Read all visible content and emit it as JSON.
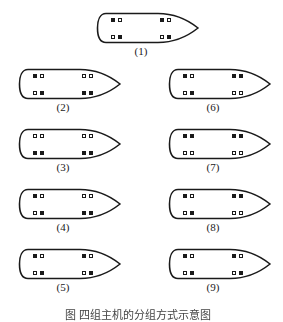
{
  "figure": {
    "caption": "图 四组主机的分组方式示意图",
    "ships": [
      {
        "id": "1",
        "label": "(1)",
        "top_left": [
          "filled",
          "empty"
        ],
        "top_right": [
          "filled",
          "empty"
        ],
        "bottom_left": [
          "empty",
          "filled"
        ],
        "bottom_right": [
          "empty",
          "filled"
        ]
      },
      {
        "id": "2",
        "label": "(2)",
        "top_left": [
          "filled",
          "empty"
        ],
        "top_right": [
          "empty",
          "empty"
        ],
        "bottom_left": [
          "empty",
          "filled"
        ],
        "bottom_right": [
          "filled",
          "filled"
        ]
      },
      {
        "id": "3",
        "label": "(3)",
        "top_left": [
          "empty",
          "empty"
        ],
        "top_right": [
          "empty",
          "empty"
        ],
        "bottom_left": [
          "filled",
          "filled"
        ],
        "bottom_right": [
          "filled",
          "filled"
        ]
      },
      {
        "id": "4",
        "label": "(4)",
        "top_left": [
          "filled",
          "empty"
        ],
        "top_right": [
          "empty",
          "empty"
        ],
        "bottom_left": [
          "empty",
          "filled"
        ],
        "bottom_right": [
          "filled",
          "filled"
        ]
      },
      {
        "id": "5",
        "label": "(5)",
        "top_left": [
          "filled",
          "empty"
        ],
        "top_right": [
          "filled",
          "empty"
        ],
        "bottom_left": [
          "empty",
          "filled"
        ],
        "bottom_right": [
          "empty",
          "filled"
        ]
      },
      {
        "id": "6",
        "label": "(6)",
        "top_left": [
          "filled",
          "empty"
        ],
        "top_right": [
          "filled",
          "filled"
        ],
        "bottom_left": [
          "empty",
          "filled"
        ],
        "bottom_right": [
          "empty",
          "empty"
        ]
      },
      {
        "id": "7",
        "label": "(7)",
        "top_left": [
          "filled",
          "filled"
        ],
        "top_right": [
          "filled",
          "filled"
        ],
        "bottom_left": [
          "empty",
          "empty"
        ],
        "bottom_right": [
          "empty",
          "empty"
        ]
      },
      {
        "id": "8",
        "label": "(8)",
        "top_left": [
          "filled",
          "empty"
        ],
        "top_right": [
          "filled",
          "filled"
        ],
        "bottom_left": [
          "empty",
          "filled"
        ],
        "bottom_right": [
          "empty",
          "empty"
        ]
      },
      {
        "id": "9",
        "label": "(9)",
        "top_left": [
          "filled",
          "empty"
        ],
        "top_right": [
          "filled",
          "empty"
        ],
        "bottom_left": [
          "empty",
          "filled"
        ],
        "bottom_right": [
          "empty",
          "filled"
        ]
      }
    ]
  }
}
